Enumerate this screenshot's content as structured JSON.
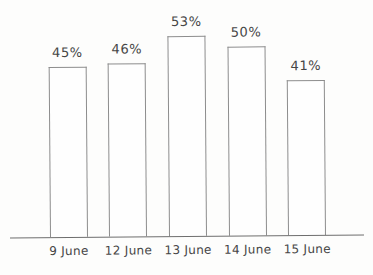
{
  "chart_data": {
    "type": "bar",
    "categories": [
      "9 June",
      "12 June",
      "13 June",
      "14 June",
      "15 June"
    ],
    "values": [
      45,
      46,
      53,
      50,
      41
    ],
    "value_labels": [
      "45%",
      "46%",
      "53%",
      "50%",
      "41%"
    ],
    "title": "",
    "xlabel": "",
    "ylabel": "",
    "ylim": [
      0,
      60
    ],
    "grid": false,
    "legend": false,
    "colors": {
      "bar_fill": "#fefefe",
      "bar_border": "#8d8d8d",
      "axis_line": "#6e6e6e",
      "text": "#464646"
    }
  }
}
